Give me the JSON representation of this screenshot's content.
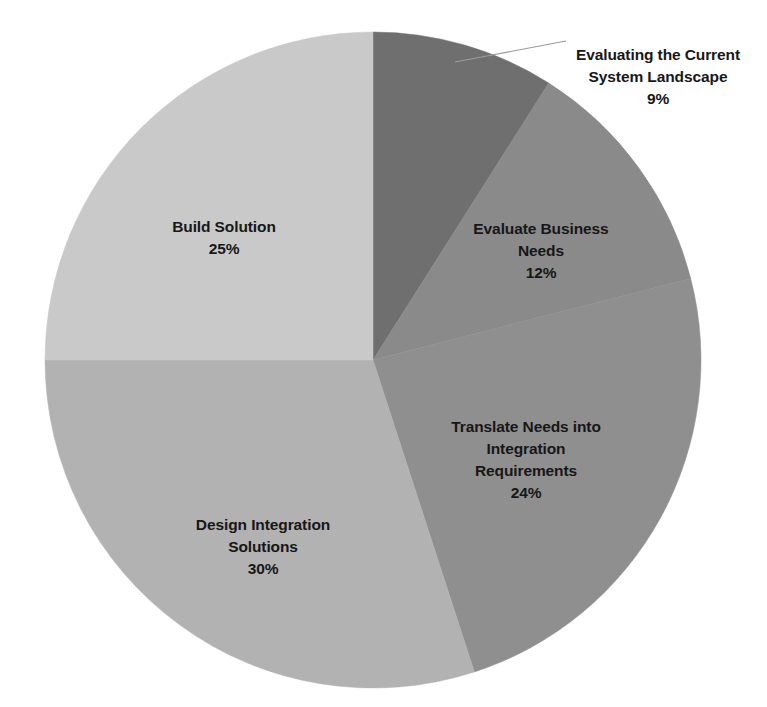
{
  "chart": {
    "title": "",
    "title_visible": false
  },
  "chart_data": {
    "type": "pie",
    "title": "",
    "xlabel": "",
    "ylabel": "",
    "legend": "none",
    "grid": false,
    "start_angle_deg": 0,
    "direction": "clockwise",
    "value_unit": "%",
    "categories": [
      "Evaluating the Current System Landscape",
      "Evaluate Business Needs",
      "Translate Needs into Integration Requirements",
      "Design Integration Solutions",
      "Build Solution"
    ],
    "values": [
      9,
      12,
      24,
      30,
      25
    ],
    "labels": [
      "Evaluating the Current\nSystem Landscape",
      "Evaluate Business\nNeeds",
      "Translate Needs into\nIntegration\nRequirements",
      "Design Integration\nSolutions",
      "Build Solution"
    ],
    "value_labels": [
      "9%",
      "12%",
      "24%",
      "30%",
      "25%"
    ],
    "colors": [
      "#6f6f6f",
      "#8a8a8a",
      "#8f8f8f",
      "#b2b2b2",
      "#c9c9c9"
    ],
    "slices": [
      {
        "name": "Evaluating the Current System Landscape",
        "label": "Evaluating the Current\nSystem Landscape",
        "value": 9,
        "value_label": "9%",
        "color": "#6f6f6f",
        "label_placement": "outside-callout",
        "leader_line": true
      },
      {
        "name": "Evaluate Business Needs",
        "label": "Evaluate Business\nNeeds",
        "value": 12,
        "value_label": "12%",
        "color": "#8a8a8a",
        "label_placement": "inside",
        "leader_line": false
      },
      {
        "name": "Translate Needs into Integration Requirements",
        "label": "Translate Needs into\nIntegration\nRequirements",
        "value": 24,
        "value_label": "24%",
        "color": "#8f8f8f",
        "label_placement": "inside",
        "leader_line": false
      },
      {
        "name": "Design Integration Solutions",
        "label": "Design Integration\nSolutions",
        "value": 30,
        "value_label": "30%",
        "color": "#b2b2b2",
        "label_placement": "inside",
        "leader_line": false
      },
      {
        "name": "Build Solution",
        "label": "Build Solution",
        "value": 25,
        "value_label": "25%",
        "color": "#c9c9c9",
        "label_placement": "inside",
        "leader_line": false
      }
    ]
  }
}
